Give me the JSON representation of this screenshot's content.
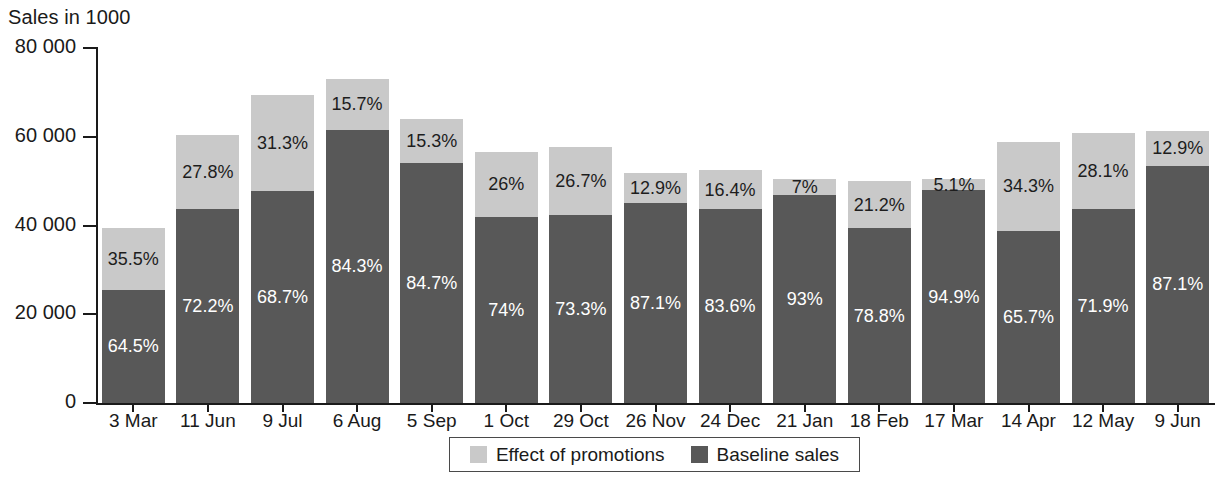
{
  "chart_data": {
    "type": "bar",
    "subtype": "stacked-bar",
    "title": "",
    "ylabel": "Sales in 1000",
    "xlabel": "",
    "ylim": [
      0,
      80000
    ],
    "yticks": [
      0,
      20000,
      40000,
      60000,
      80000
    ],
    "ytick_labels": [
      "0",
      "20 000",
      "40 000",
      "60 000",
      "80 000"
    ],
    "grid": false,
    "legend_position": "bottom-center",
    "categories": [
      "3 Mar",
      "11 Jun",
      "9 Jul",
      "6 Aug",
      "5 Sep",
      "1 Oct",
      "29 Oct",
      "26 Nov",
      "24 Dec",
      "21 Jan",
      "18 Feb",
      "17 Mar",
      "14 Apr",
      "12 May",
      "9 Jun"
    ],
    "series": [
      {
        "name": "Baseline sales",
        "color": "#585858",
        "values": [
          25500,
          43700,
          47700,
          61600,
          54100,
          41900,
          42300,
          45100,
          43800,
          46900,
          39400,
          47900,
          38700,
          43700,
          53500
        ],
        "labels": [
          "64.5%",
          "72.2%",
          "68.7%",
          "84.3%",
          "84.7%",
          "74%",
          "73.3%",
          "87.1%",
          "83.6%",
          "93%",
          "78.8%",
          "94.9%",
          "65.7%",
          "71.9%",
          "87.1%"
        ]
      },
      {
        "name": "Effect of promotions",
        "color": "#c9c9c9",
        "values": [
          14000,
          16800,
          21700,
          11500,
          9800,
          14700,
          15400,
          6700,
          8600,
          3500,
          10600,
          2600,
          20200,
          17100,
          7900
        ],
        "labels": [
          "35.5%",
          "27.8%",
          "31.3%",
          "15.7%",
          "15.3%",
          "26%",
          "26.7%",
          "12.9%",
          "16.4%",
          "7%",
          "21.2%",
          "5.1%",
          "34.3%",
          "28.1%",
          "12.9%"
        ]
      }
    ],
    "totals": [
      39500,
      60500,
      69400,
      73100,
      63900,
      56600,
      57700,
      51800,
      52400,
      50400,
      50000,
      50500,
      58900,
      60800,
      61400
    ],
    "annotations": []
  },
  "legend": {
    "items": [
      {
        "label": "Effect of promotions",
        "color": "#c9c9c9",
        "swatch_name": "legend-swatch-promotions"
      },
      {
        "label": "Baseline sales",
        "color": "#585858",
        "swatch_name": "legend-swatch-baseline"
      }
    ]
  }
}
